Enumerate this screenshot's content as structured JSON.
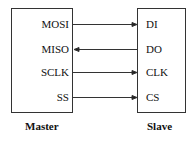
{
  "master": {
    "label": "Master",
    "pins": [
      "MOSI",
      "MISO",
      "SCLK",
      "SS"
    ]
  },
  "slave": {
    "label": "Slave",
    "pins": [
      "DI",
      "DO",
      "CLK",
      "CS"
    ]
  },
  "connections": [
    {
      "from": "MOSI",
      "to": "DI",
      "direction": "master-to-slave"
    },
    {
      "from": "DO",
      "to": "MISO",
      "direction": "slave-to-master"
    },
    {
      "from": "SCLK",
      "to": "CLK",
      "direction": "master-to-slave"
    },
    {
      "from": "SS",
      "to": "CS",
      "direction": "master-to-slave"
    }
  ]
}
